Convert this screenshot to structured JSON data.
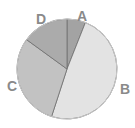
{
  "chart_data": {
    "type": "pie",
    "title": "",
    "categories": [
      "A",
      "B",
      "C",
      "D"
    ],
    "values": [
      6,
      49,
      30,
      15
    ],
    "colors": [
      "#a3a3a3",
      "#e3e3e3",
      "#c2c2c2",
      "#ababab"
    ],
    "start_angle": "12 o'clock",
    "direction": "clockwise",
    "legend": "none (labels placed outside slices)"
  },
  "labels": {
    "a": "A",
    "b": "B",
    "c": "C",
    "d": "D"
  }
}
